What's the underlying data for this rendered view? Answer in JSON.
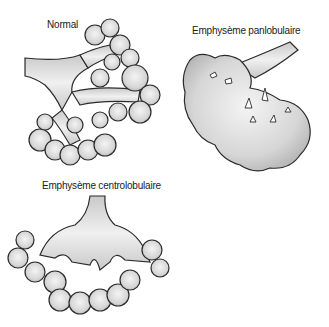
{
  "figure": {
    "panels": [
      {
        "id": "normal",
        "label": "Normal"
      },
      {
        "id": "panlobular",
        "label": "Emphysème panlobulaire"
      },
      {
        "id": "centrilobular",
        "label": "Emphysème centrolobulaire"
      }
    ],
    "colors": {
      "tissue_fill": "#d9d9d9",
      "tissue_light": "#f2f2f2",
      "outline": "#2b2b2b",
      "background": "#ffffff"
    }
  }
}
